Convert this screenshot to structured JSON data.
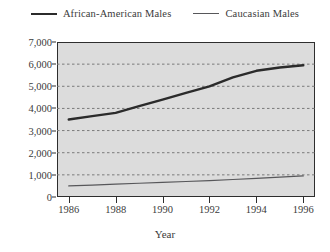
{
  "chart_data": {
    "type": "line",
    "title": "",
    "xlabel": "Year",
    "ylabel": "",
    "x": [
      1986,
      1987,
      1988,
      1989,
      1990,
      1991,
      1992,
      1993,
      1994,
      1995,
      1996
    ],
    "xlim": [
      1985.5,
      1996.5
    ],
    "ylim": [
      0,
      7000
    ],
    "ytick_values": [
      0,
      1000,
      2000,
      3000,
      4000,
      5000,
      6000,
      7000
    ],
    "ytick_labels": [
      "0",
      "1,000",
      "2,000",
      "3,000",
      "4,000",
      "5,000",
      "6,000",
      "7,000"
    ],
    "xtick_values": [
      1986,
      1988,
      1990,
      1992,
      1994,
      1996
    ],
    "xtick_labels": [
      "1986",
      "1988",
      "1990",
      "1992",
      "1994",
      "1996"
    ],
    "grid": "horizontal-dotted",
    "legend_position": "top-center",
    "plot_background": "#dcdcdc",
    "series": [
      {
        "name": "African-American Males",
        "color": "#2b2b2b",
        "line_width": 2.4,
        "values": [
          3500,
          3650,
          3800,
          4100,
          4400,
          4700,
          5000,
          5400,
          5700,
          5850,
          5950
        ]
      },
      {
        "name": "Caucasian Males",
        "color": "#57575a",
        "line_width": 1.2,
        "values": [
          500,
          540,
          580,
          620,
          660,
          700,
          740,
          790,
          840,
          900,
          950
        ]
      }
    ]
  },
  "legend": {
    "entries": [
      {
        "label": "African-American Males"
      },
      {
        "label": "Caucasian Males"
      }
    ]
  },
  "axis": {
    "x_title": "Year"
  }
}
